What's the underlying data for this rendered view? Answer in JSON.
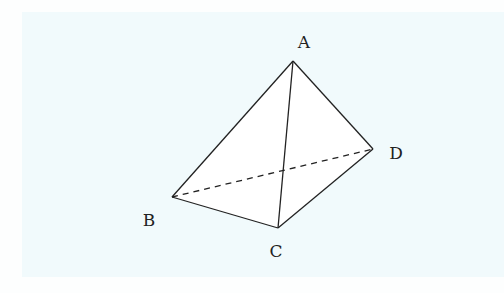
{
  "figure": {
    "type": "tetrahedron",
    "background_color": "#f1fafc",
    "stroke_color": "#222222",
    "face_color": "#ffffff",
    "vertices": {
      "A": {
        "label": "A",
        "x": 293,
        "y": 61,
        "label_x": 304,
        "label_y": 48
      },
      "B": {
        "label": "B",
        "x": 172,
        "y": 197,
        "label_x": 149,
        "label_y": 226
      },
      "C": {
        "label": "C",
        "x": 278,
        "y": 228,
        "label_x": 276,
        "label_y": 257
      },
      "D": {
        "label": "D",
        "x": 373,
        "y": 149,
        "label_x": 396,
        "label_y": 159
      }
    },
    "solid_edges": [
      [
        "A",
        "B"
      ],
      [
        "A",
        "C"
      ],
      [
        "A",
        "D"
      ],
      [
        "B",
        "C"
      ],
      [
        "C",
        "D"
      ]
    ],
    "dashed_edges": [
      [
        "B",
        "D"
      ]
    ]
  }
}
